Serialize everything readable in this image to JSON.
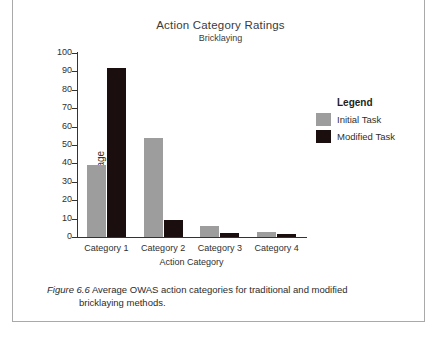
{
  "chart_data": {
    "type": "bar",
    "title": "Action Category Ratings",
    "subtitle": "Bricklaying",
    "xlabel": "Action Category",
    "ylabel": "Percentage",
    "ylim": [
      0,
      100
    ],
    "ytick_step": 10,
    "yticks": [
      "100",
      "90",
      "80",
      "70",
      "60",
      "50",
      "40",
      "30",
      "20",
      "10",
      "0"
    ],
    "grid": false,
    "legend_position": "right",
    "legend_title": "Legend",
    "categories": [
      "Category 1",
      "Category 2",
      "Category 3",
      "Category 4"
    ],
    "series": [
      {
        "name": "Initial Task",
        "color": "#9d9d9d",
        "values": [
          39,
          54,
          6,
          2.5
        ]
      },
      {
        "name": "Modified Task",
        "color": "#1a0e0e",
        "values": [
          92,
          9.5,
          2,
          1.5
        ]
      }
    ]
  },
  "caption": {
    "label": "Figure  6.6",
    "line1": "Average OWAS action categories for traditional and modified",
    "line2": "bricklaying methods."
  }
}
